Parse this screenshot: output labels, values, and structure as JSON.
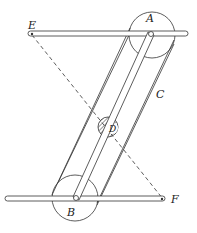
{
  "diagram": {
    "labels": {
      "A": "A",
      "B": "B",
      "C": "C",
      "D": "D",
      "E": "E",
      "F": "F"
    },
    "colors": {
      "stroke": "#333333",
      "background": "#ffffff"
    }
  }
}
